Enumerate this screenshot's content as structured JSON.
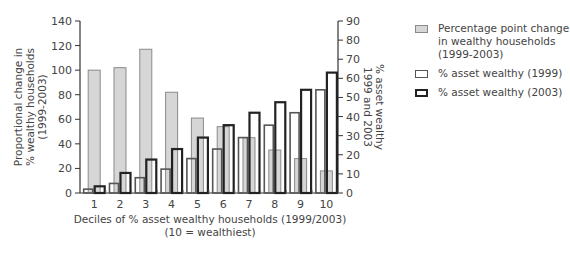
{
  "chart_data": {
    "type": "bar",
    "title": "",
    "categories": [
      "1",
      "2",
      "3",
      "4",
      "5",
      "6",
      "7",
      "8",
      "9",
      "10"
    ],
    "xlabel": "Deciles of % asset wealthy households (1999/2003)",
    "xlabel_sub": "(10 = wealthiest)",
    "ylabel_left": [
      "Proportional change in",
      "% wealthy households",
      "(1999-2003)"
    ],
    "ylabel_right": [
      "% asset wealthy",
      "1999 and 2003"
    ],
    "ylim_left": [
      0,
      140
    ],
    "yticks_left": [
      0,
      20,
      40,
      60,
      80,
      100,
      120,
      140
    ],
    "ylim_right": [
      0,
      90
    ],
    "yticks_right": [
      0,
      10,
      20,
      30,
      40,
      50,
      60,
      70,
      80,
      90
    ],
    "grid": false,
    "legend_position": "right",
    "series": [
      {
        "name": "Percentage point change in wealthy households (1999-2003)",
        "axis": "left",
        "style": "grey-fill",
        "values": [
          100,
          102,
          117,
          82,
          61,
          54,
          45,
          35,
          28,
          18
        ]
      },
      {
        "name": "% asset wealthy (1999)",
        "axis": "right",
        "style": "thin-outline",
        "values": [
          2,
          5,
          8,
          12.5,
          18,
          23,
          29,
          35.5,
          42,
          54
        ]
      },
      {
        "name": "% asset wealthy (2003)",
        "axis": "right",
        "style": "thick-outline",
        "values": [
          3.5,
          10.5,
          17.5,
          23,
          29,
          35.5,
          42,
          47.5,
          54,
          63
        ]
      }
    ]
  },
  "legend": {
    "items": [
      {
        "label": "Percentage point change\nin wealthy households\n(1999-2003)"
      },
      {
        "label": "% asset wealthy (1999)"
      },
      {
        "label": "% asset wealthy (2003)"
      }
    ]
  },
  "axis": {
    "xlabel": "Deciles of % asset wealthy households (1999/2003)",
    "xlabel_sub": "(10 = wealthiest)"
  }
}
